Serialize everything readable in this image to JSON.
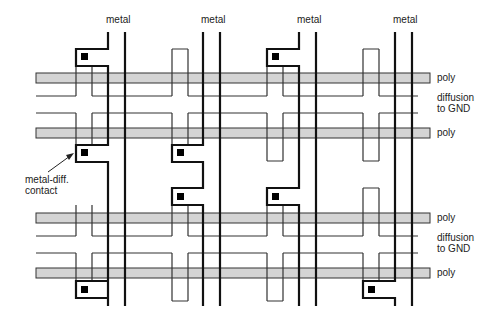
{
  "diagram": {
    "title": "",
    "labels": {
      "metal": [
        "metal",
        "metal",
        "metal",
        "metal"
      ],
      "poly": [
        "poly",
        "poly",
        "poly",
        "poly"
      ],
      "diffusion_line1": [
        "diffusion",
        "diffusion"
      ],
      "diffusion_line2": [
        "to GND",
        "to GND"
      ],
      "contact_line1": "metal-diff.",
      "contact_line2": "contact"
    },
    "colors": {
      "poly": "#d4d4d4",
      "line": "#111111",
      "diffusion": "#333333",
      "contact": "#000000"
    },
    "layers": [
      "metal",
      "poly",
      "diffusion to GND",
      "metal-diff. contact"
    ]
  }
}
